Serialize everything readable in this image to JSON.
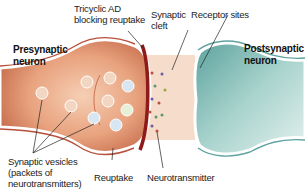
{
  "diagram": {
    "type": "synapse-illustration",
    "labels": {
      "presynaptic": [
        "Presynaptic",
        "neuron"
      ],
      "postsynaptic": [
        "Postsynaptic",
        "neuron"
      ],
      "tricyclic": [
        "Tricyclic AD",
        "blocking reuptake"
      ],
      "cleft": [
        "Synaptic",
        "cleft"
      ],
      "receptor": "Receptor sites",
      "vesicles": [
        "Synaptic vesicles",
        "(packets of",
        "neurotransmitters)"
      ],
      "reuptake": "Reuptake",
      "neurotransmitter": "Neurotransmitter"
    },
    "colors": {
      "presynaptic_fill": "#e9a07a",
      "presynaptic_membrane": "#b8503a",
      "postsynaptic_fill": "#8fc3bf",
      "postsynaptic_membrane": "#5fa3a0",
      "cleft_fill": "#f6dccb",
      "blocker": "#8e1a1a",
      "leader_line": "#222222"
    }
  }
}
